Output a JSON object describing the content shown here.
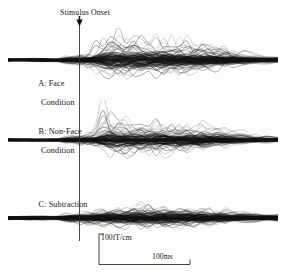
{
  "figure": {
    "background_color": "#fdfdfc",
    "trace_color": "#1a1a1a",
    "axis_color": "#2b2b2b"
  },
  "annotations": {
    "stimulus_onset_label": "Stimulus Onset",
    "stimulus_onset_arrow_icon": "down-arrow-icon",
    "onset_line_icon": "vertical-onset-line"
  },
  "panels": [
    {
      "id": "A",
      "label_line1": "A: Face",
      "label_line2": "Condition"
    },
    {
      "id": "B",
      "label_line1": "B: Non-Face",
      "label_line2": "Condition"
    },
    {
      "id": "C",
      "label_line1": "C: Subtraction",
      "label_line2": ""
    }
  ],
  "scale_bars": {
    "vertical_label": "100fT/cm",
    "horizontal_label": "100ms"
  },
  "chart_data": {
    "type": "line",
    "xlabel": "",
    "ylabel": "",
    "grid": false,
    "legend_position": "none",
    "x_scale_bar_ms": 100,
    "y_scale_bar_fT_per_cm": 100,
    "stimulus_onset_x_ms": 0,
    "x_range_ms": [
      -150,
      560
    ],
    "panel_count": 3,
    "traces_per_panel": 64,
    "panels": [
      {
        "name": "A: Face Condition",
        "baseline_y": 60,
        "description": "Dense overlay of channel traces; flat pre-stimulus baseline, large deflections beginning ~100 ms post-onset with peak envelope around 130-200 ms and sustained activity to ~450 ms",
        "envelope_x": [
          -150,
          -120,
          -90,
          -60,
          -30,
          0,
          20,
          40,
          60,
          80,
          100,
          120,
          140,
          160,
          180,
          200,
          220,
          240,
          260,
          280,
          300,
          320,
          340,
          360,
          380,
          400,
          420,
          440,
          470,
          500,
          530,
          560
        ],
        "envelope_upper": [
          4,
          4,
          4,
          5,
          4,
          4,
          5,
          6,
          7,
          9,
          22,
          34,
          30,
          26,
          30,
          27,
          24,
          26,
          24,
          22,
          23,
          20,
          19,
          21,
          18,
          17,
          16,
          12,
          9,
          7,
          5,
          4
        ],
        "envelope_lower": [
          -4,
          -4,
          -4,
          -5,
          -4,
          -4,
          -5,
          -6,
          -7,
          -9,
          -14,
          -17,
          -20,
          -22,
          -18,
          -20,
          -17,
          -16,
          -18,
          -17,
          -15,
          -16,
          -14,
          -13,
          -12,
          -11,
          -9,
          -8,
          -6,
          -5,
          -4,
          -3
        ]
      },
      {
        "name": "B: Non-Face Condition",
        "baseline_y": 140,
        "description": "Dense overlay of channel traces; flat baseline then sharp narrow peak near 120 ms exceeding panel bounds, followed by broad multi-peak activity through ~450 ms",
        "envelope_x": [
          -150,
          -120,
          -90,
          -60,
          -30,
          0,
          20,
          40,
          60,
          80,
          100,
          120,
          140,
          160,
          180,
          200,
          220,
          240,
          260,
          280,
          300,
          320,
          340,
          360,
          380,
          400,
          420,
          440,
          470,
          500,
          530,
          560
        ],
        "envelope_upper": [
          4,
          4,
          4,
          4,
          4,
          4,
          5,
          6,
          7,
          9,
          30,
          44,
          24,
          18,
          20,
          22,
          19,
          21,
          20,
          18,
          22,
          19,
          17,
          20,
          16,
          15,
          14,
          11,
          8,
          6,
          5,
          4
        ],
        "envelope_lower": [
          -4,
          -4,
          -4,
          -4,
          -4,
          -4,
          -5,
          -6,
          -7,
          -9,
          -12,
          -15,
          -22,
          -24,
          -20,
          -18,
          -19,
          -17,
          -20,
          -18,
          -16,
          -17,
          -15,
          -13,
          -12,
          -10,
          -9,
          -7,
          -6,
          -5,
          -4,
          -3
        ]
      },
      {
        "name": "C: Subtraction",
        "baseline_y": 218,
        "description": "Difference waveform overlay; smaller amplitudes overall, broad low-amplitude deflections distributed from ~100 ms to ~450 ms",
        "envelope_x": [
          -150,
          -120,
          -90,
          -60,
          -30,
          0,
          20,
          40,
          60,
          80,
          100,
          120,
          140,
          160,
          180,
          200,
          220,
          240,
          260,
          280,
          300,
          320,
          340,
          360,
          380,
          400,
          420,
          440,
          470,
          500,
          530,
          560
        ],
        "envelope_upper": [
          5,
          5,
          6,
          6,
          5,
          5,
          6,
          7,
          8,
          9,
          11,
          13,
          12,
          11,
          16,
          18,
          14,
          13,
          15,
          14,
          13,
          15,
          12,
          13,
          11,
          10,
          9,
          8,
          7,
          6,
          5,
          4
        ],
        "envelope_lower": [
          -5,
          -5,
          -6,
          -6,
          -5,
          -5,
          -6,
          -7,
          -8,
          -9,
          -10,
          -11,
          -12,
          -11,
          -12,
          -13,
          -12,
          -11,
          -13,
          -12,
          -11,
          -12,
          -10,
          -11,
          -9,
          -8,
          -7,
          -6,
          -5,
          -5,
          -4,
          -4
        ]
      }
    ]
  }
}
